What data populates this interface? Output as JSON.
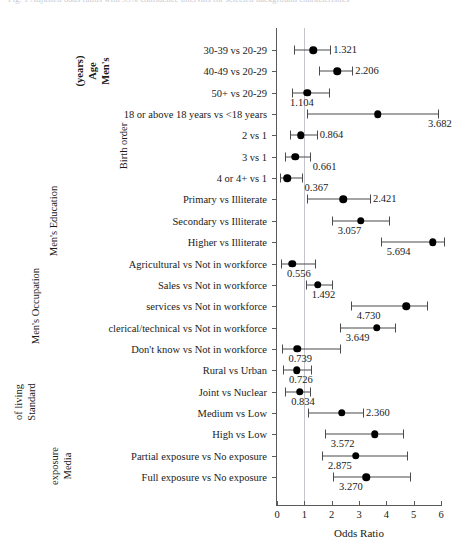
{
  "figure": {
    "caption_cut": "Fig. 1  Adjusted odds ratios with 95% confidence intervals for selected background characteristics"
  },
  "chart_data": {
    "type": "scatter",
    "subtype": "forest-plot",
    "title": "",
    "xlabel": "Odds Ratio",
    "ylabel": "",
    "xlim": [
      0,
      6
    ],
    "xticks": [
      0,
      1,
      2,
      3,
      4,
      5,
      6
    ],
    "xtick_labels": [
      "0",
      "1",
      "2",
      "3",
      "4",
      "5",
      "6"
    ],
    "reference_line": 1,
    "grid": false,
    "legend": null,
    "groups": [
      {
        "name": "Men's Age (years)",
        "bold": true,
        "lines": [
          "Men's",
          "Age",
          "(years)"
        ],
        "rows": [
          0,
          1,
          2
        ]
      },
      {
        "name": "Birth order",
        "bold": false,
        "lines": [
          "Birth order"
        ],
        "rows": [
          3,
          4,
          5,
          6
        ]
      },
      {
        "name": "Men's Education",
        "bold": false,
        "lines": [
          "Men's Education"
        ],
        "rows": [
          7,
          8,
          9
        ]
      },
      {
        "name": "Men's Occupation",
        "bold": false,
        "lines": [
          "Men's Occupation"
        ],
        "rows": [
          10,
          11,
          12,
          13,
          14
        ]
      },
      {
        "name": "Standard of living",
        "bold": false,
        "lines": [
          "Standard",
          "of living"
        ],
        "rows": [
          15,
          16,
          17,
          18
        ]
      },
      {
        "name": "Media exposure",
        "bold": false,
        "lines": [
          "Media",
          "exposure"
        ],
        "rows": [
          19,
          20
        ]
      }
    ],
    "categories": [
      "30-39 vs 20-29",
      "40-49 vs 20-29",
      "50+ vs 20-29",
      "18 or above 18 years vs <18 years",
      "2 vs 1",
      "3 vs 1",
      "4 or 4+ vs 1",
      "Primary vs Illiterate",
      "Secondary vs Illiterate",
      "Higher vs Illiterate",
      "Agricultural vs Not in workforce",
      "Sales vs Not in workforce",
      "services vs Not in workforce",
      "clerical/technical vs Not in workforce",
      "Don't know vs Not in workforce",
      "Rural vs Urban",
      "Joint vs Nuclear",
      "Medium vs Low",
      "High vs Low",
      "Partial exposure vs No exposure",
      "Full exposure vs No exposure"
    ],
    "values": [
      1.321,
      2.206,
      1.104,
      3.682,
      0.864,
      0.661,
      0.367,
      2.421,
      3.057,
      5.694,
      0.556,
      1.492,
      4.73,
      3.649,
      0.739,
      0.726,
      0.834,
      2.36,
      3.572,
      2.875,
      3.27
    ],
    "value_labels": [
      "1.321",
      "2.206",
      "1.104",
      "3.682",
      "0.864",
      "0.661",
      "0.367",
      "2.421",
      "3.057",
      "5.694",
      "0.556",
      "1.492",
      "4.730",
      "3.649",
      "0.739",
      "0.726",
      "0.834",
      "2.360",
      "3.572",
      "2.875",
      "3.270"
    ],
    "ci_lower": [
      0.64,
      1.55,
      0.55,
      1.1,
      0.46,
      0.3,
      0.1,
      1.1,
      2.0,
      3.8,
      0.15,
      1.05,
      2.7,
      2.3,
      0.2,
      0.22,
      0.3,
      1.12,
      1.75,
      1.65,
      2.05
    ],
    "ci_upper": [
      1.95,
      2.75,
      1.9,
      5.9,
      1.45,
      1.2,
      0.9,
      3.4,
      4.1,
      6.1,
      1.4,
      2.0,
      5.5,
      4.3,
      2.3,
      1.25,
      1.22,
      3.15,
      4.6,
      4.75,
      4.85
    ],
    "label_side": [
      "right",
      "right",
      "below-left",
      "below-right",
      "right",
      "below-right",
      "below-right",
      "right",
      "below",
      "below",
      "below",
      "below",
      "below",
      "below",
      "below",
      "below",
      "below",
      "right",
      "below",
      "below",
      "below"
    ]
  }
}
